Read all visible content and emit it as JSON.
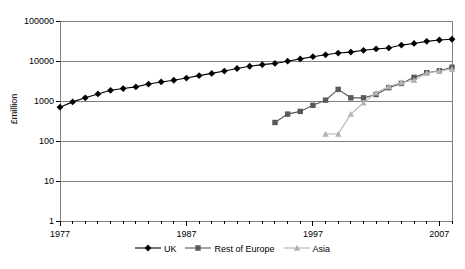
{
  "chart_data": {
    "type": "line",
    "title": "",
    "subtitle": "",
    "xlabel": "",
    "ylabel": "£million",
    "yscale": "log",
    "ylim": [
      1,
      100000
    ],
    "ytick_labels": [
      "100000",
      "10000",
      "1000",
      "100",
      "10",
      "1"
    ],
    "ytick_values": [
      100000,
      10000,
      1000,
      100,
      10,
      1
    ],
    "xlim": [
      1977,
      2008
    ],
    "xtick_labels": [
      "1977",
      "1987",
      "1997",
      "2007"
    ],
    "xtick_values": [
      1977,
      1987,
      1997,
      2007
    ],
    "minor_xticks_every": 1,
    "grid": "horizontal",
    "legend_position": "bottom",
    "series": [
      {
        "name": "UK",
        "color": "#000000",
        "marker": "diamond",
        "x": [
          1977,
          1978,
          1979,
          1980,
          1981,
          1982,
          1983,
          1984,
          1985,
          1986,
          1987,
          1988,
          1989,
          1990,
          1991,
          1992,
          1993,
          1994,
          1995,
          1996,
          1997,
          1998,
          1999,
          2000,
          2001,
          2002,
          2003,
          2004,
          2005,
          2006,
          2007,
          2008
        ],
        "values": [
          700,
          950,
          1200,
          1500,
          1850,
          2050,
          2250,
          2650,
          3000,
          3300,
          3750,
          4300,
          4900,
          5600,
          6500,
          7400,
          8100,
          8700,
          9900,
          11300,
          12800,
          14300,
          15800,
          16700,
          18500,
          20000,
          21200,
          25000,
          27500,
          31000,
          33500,
          35000
        ]
      },
      {
        "name": "Rest of Europe",
        "color": "#595959",
        "marker": "square",
        "x": [
          1994,
          1995,
          1996,
          1997,
          1998,
          1999,
          2000,
          2001,
          2002,
          2003,
          2004,
          2005,
          2006,
          2007,
          2008
        ],
        "values": [
          290,
          470,
          550,
          780,
          1050,
          1950,
          1200,
          1200,
          1450,
          2150,
          2750,
          3900,
          5100,
          5700,
          7000
        ]
      },
      {
        "name": "Asia",
        "color": "#b3b3b3",
        "marker": "triangle",
        "x": [
          1998,
          1999,
          2000,
          2001,
          2002,
          2003,
          2004,
          2005,
          2006,
          2007,
          2008
        ],
        "values": [
          150,
          150,
          470,
          900,
          1600,
          2300,
          2900,
          3300,
          5000,
          5600,
          6200
        ]
      }
    ]
  },
  "legend": {
    "items": [
      {
        "label": "UK"
      },
      {
        "label": "Rest of Europe"
      },
      {
        "label": "Asia"
      }
    ]
  }
}
